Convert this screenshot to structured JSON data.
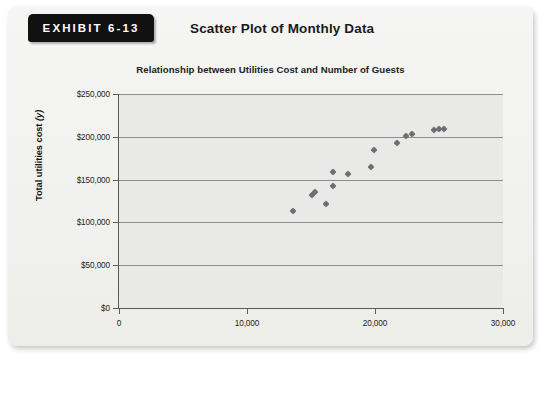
{
  "exhibit": {
    "tab_label": "EXHIBIT 6-13",
    "title": "Scatter Plot of Monthly Data"
  },
  "chart_data": {
    "type": "scatter",
    "title": "Relationship between Utilities Cost and Number of Guests",
    "xlabel": "Volume (number of guests) (x)",
    "ylabel": "Total utilities cost (y)",
    "xlim": [
      0,
      30000
    ],
    "ylim": [
      0,
      250000
    ],
    "xticks": [
      0,
      10000,
      20000,
      30000
    ],
    "xtick_labels": [
      "0",
      "10,000",
      "20,000",
      "30,000"
    ],
    "yticks": [
      0,
      50000,
      100000,
      150000,
      200000,
      250000
    ],
    "ytick_labels": [
      "$0",
      "$50,000",
      "$100,000",
      "$150,000",
      "$200,000",
      "$250,000"
    ],
    "grid": "horizontal",
    "legend": "none",
    "marker": "diamond",
    "marker_color": "#6f6f72",
    "plot_background": "#e9e9e7",
    "points": [
      {
        "x": 13600,
        "y": 113000
      },
      {
        "x": 15100,
        "y": 132000
      },
      {
        "x": 15300,
        "y": 136000
      },
      {
        "x": 16200,
        "y": 122000
      },
      {
        "x": 16700,
        "y": 143000
      },
      {
        "x": 16700,
        "y": 159000
      },
      {
        "x": 17900,
        "y": 157000
      },
      {
        "x": 19700,
        "y": 165000
      },
      {
        "x": 19900,
        "y": 185000
      },
      {
        "x": 21700,
        "y": 193000
      },
      {
        "x": 22400,
        "y": 201000
      },
      {
        "x": 22900,
        "y": 203000
      },
      {
        "x": 24600,
        "y": 208000
      },
      {
        "x": 25000,
        "y": 209000
      },
      {
        "x": 25400,
        "y": 209000
      }
    ]
  }
}
